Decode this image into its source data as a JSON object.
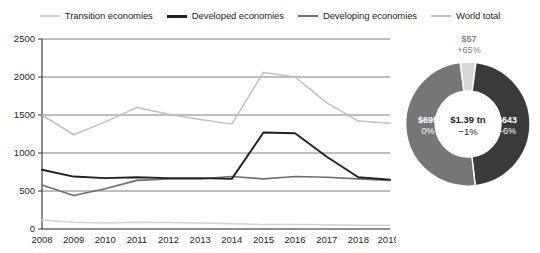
{
  "legend": {
    "items": [
      {
        "label": "Transition economies",
        "color": "#d2d2d2"
      },
      {
        "label": "Developed economies",
        "color": "#231f20"
      },
      {
        "label": "Developing economies",
        "color": "#6f6f6f"
      },
      {
        "label": "World total",
        "color": "#c0c0c0"
      }
    ]
  },
  "chart_data": [
    {
      "type": "line",
      "title": "",
      "xlabel": "",
      "ylabel": "",
      "ylim": [
        0,
        2500
      ],
      "yticks": [
        0,
        500,
        1000,
        1500,
        2000,
        2500
      ],
      "grid": true,
      "legend_position": "top",
      "categories": [
        "2008",
        "2009",
        "2010",
        "2011",
        "2012",
        "2013",
        "2014",
        "2015",
        "2016",
        "2017",
        "2018",
        "2019*"
      ],
      "series": [
        {
          "name": "World total",
          "color": "#c0c0c0",
          "values": [
            1500,
            1240,
            1410,
            1600,
            1510,
            1440,
            1380,
            2060,
            2000,
            1660,
            1420,
            1390
          ]
        },
        {
          "name": "Developed economies",
          "color": "#231f20",
          "values": [
            780,
            690,
            670,
            680,
            670,
            670,
            660,
            1270,
            1260,
            950,
            680,
            650
          ]
        },
        {
          "name": "Developing economies",
          "color": "#6f6f6f",
          "values": [
            580,
            440,
            530,
            640,
            660,
            660,
            690,
            660,
            690,
            680,
            660,
            640
          ]
        },
        {
          "name": "Transition economies",
          "color": "#d2d2d2",
          "values": [
            120,
            90,
            80,
            90,
            85,
            80,
            70,
            60,
            60,
            55,
            50,
            50
          ]
        }
      ]
    },
    {
      "type": "pie",
      "variant": "donut",
      "title": "",
      "center_value": "$1.39 tn",
      "center_change": "−1%",
      "slices": [
        {
          "name": "Transition economies",
          "value": 57,
          "label_value": "$57",
          "label_change": "+65%",
          "color": "#d9d9d9",
          "label_color": "#7d7d7d"
        },
        {
          "name": "Developed economies",
          "value": 643,
          "label_value": "$643",
          "label_change": "−6%",
          "color": "#3a3a3a",
          "label_color": "#ffffff"
        },
        {
          "name": "Developing economies",
          "value": 695,
          "label_value": "$695",
          "label_change": "0%",
          "color": "#767676",
          "label_color": "#ffffff"
        }
      ]
    }
  ]
}
